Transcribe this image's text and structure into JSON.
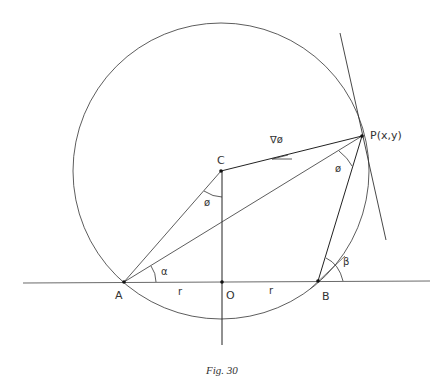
{
  "figure": {
    "caption": "Fig. 30",
    "points": {
      "A": {
        "label": "A",
        "x": 124,
        "y": 282
      },
      "O": {
        "label": "O",
        "x": 222,
        "y": 282
      },
      "B": {
        "label": "B",
        "x": 318,
        "y": 281
      },
      "C": {
        "label": "C",
        "x": 221,
        "y": 171
      },
      "P": {
        "label": "P(x,y)",
        "x": 362,
        "y": 136
      }
    },
    "labels": {
      "gradient": "∇ø",
      "phi_at_C": "ø",
      "phi_at_P": "ø",
      "alpha": "α",
      "beta": "β",
      "r_left": "r",
      "r_right": "r"
    },
    "circle": {
      "center": "C",
      "radius": 148
    },
    "colors": {
      "stroke": "#333333",
      "background": "#ffffff"
    }
  }
}
